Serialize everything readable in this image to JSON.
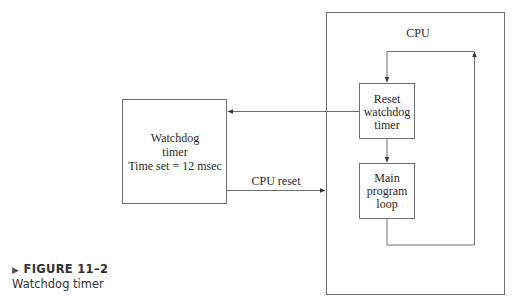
{
  "diagram": {
    "cpu_label": "CPU",
    "watchdog": {
      "line1": "Watchdog",
      "line2": "timer",
      "line3": "Time set = 12 msec"
    },
    "reset_box": {
      "line1": "Reset",
      "line2": "watchdog",
      "line3": "timer"
    },
    "main_box": {
      "line1": "Main",
      "line2": "program",
      "line3": "loop"
    },
    "cpu_reset_label": "CPU reset",
    "colors": {
      "line": "#6e6e6e",
      "text": "#2a2a2a"
    }
  },
  "caption": {
    "figure": "FIGURE 11–2",
    "title": "Watchdog timer"
  }
}
